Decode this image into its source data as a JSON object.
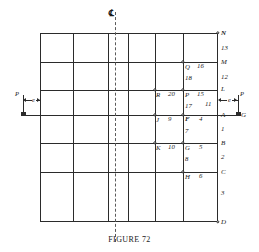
{
  "figure": {
    "caption": "FIGURE 72",
    "centerline_symbol": "℄"
  },
  "grid": {
    "columns": 6,
    "rows": 6,
    "x_positions": [
      40,
      73,
      108,
      128,
      155,
      183,
      218
    ],
    "y_positions": [
      33,
      62,
      90,
      115,
      143,
      172,
      222
    ],
    "stroke_color": "#2b2b2b"
  },
  "loads": {
    "left": {
      "force_label": "P",
      "eccentricity_label": "e"
    },
    "right": {
      "force_label": "P",
      "eccentricity_label": "e",
      "segment_label": "11"
    }
  },
  "right_edge_labels": [
    {
      "text": "N",
      "type": "point"
    },
    {
      "text": "13",
      "type": "segment"
    },
    {
      "text": "M",
      "type": "point"
    },
    {
      "text": "12",
      "type": "segment"
    },
    {
      "text": "L",
      "type": "point"
    },
    {
      "text": "A",
      "type": "point"
    },
    {
      "text": "1",
      "type": "segment"
    },
    {
      "text": "B",
      "type": "point"
    },
    {
      "text": "2",
      "type": "segment"
    },
    {
      "text": "C",
      "type": "point"
    },
    {
      "text": "3",
      "type": "segment"
    },
    {
      "text": "D",
      "type": "point"
    }
  ],
  "interior_labels": [
    {
      "point": "Q",
      "number": "16"
    },
    {
      "number": "18"
    },
    {
      "point": "R",
      "number": "20"
    },
    {
      "point": "P",
      "number": "15"
    },
    {
      "number": "17"
    },
    {
      "point": "J",
      "number": "9"
    },
    {
      "point": "F",
      "number": "4"
    },
    {
      "number": "7"
    },
    {
      "point": "K",
      "number": "10"
    },
    {
      "point": "G",
      "number": "5"
    },
    {
      "number": "8"
    },
    {
      "point": "H",
      "number": "6"
    }
  ],
  "labels": {
    "N": "N",
    "M": "M",
    "L": "L",
    "A": "A",
    "B": "B",
    "C": "C",
    "D": "D",
    "G_right": "G",
    "P_left": "P",
    "P_right": "P",
    "e_left": "e",
    "e_right": "e",
    "n13": "13",
    "n12": "12",
    "n11": "11",
    "n1": "1",
    "n2": "2",
    "n3": "3",
    "Q": "Q",
    "n16": "16",
    "n18": "18",
    "R": "R",
    "n20": "20",
    "Ppt": "P",
    "n15": "15",
    "n17": "17",
    "J": "J",
    "n9": "9",
    "F": "F",
    "n4": "4",
    "n7": "7",
    "K": "K",
    "n10": "10",
    "G": "G",
    "n5": "5",
    "n8": "8",
    "H": "H",
    "n6": "6"
  }
}
